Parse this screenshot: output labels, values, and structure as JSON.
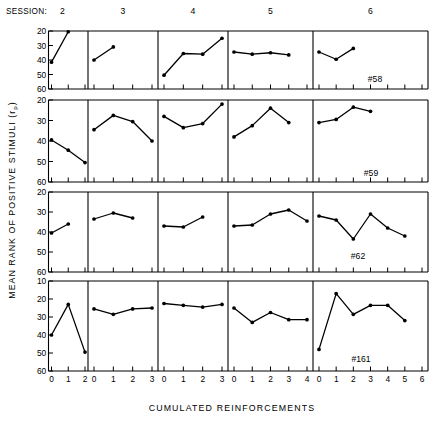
{
  "figure": {
    "session_word": "SESSION:",
    "y_axis_title_main": "MEAN RANK OF POSITIVE STIMULI (r",
    "y_axis_title_sub": "p",
    "y_axis_title_close": ")",
    "x_axis_title": "CUMULATED  REINFORCEMENTS"
  },
  "chart_data": {
    "type": "line",
    "title": "",
    "xlabel": "CUMULATED  REINFORCEMENTS",
    "ylabel": "MEAN RANK OF POSITIVE STIMULI (rp)",
    "y_inverted": true,
    "grid": false,
    "legend": "none",
    "columns": [
      {
        "session": "2",
        "x": [
          0,
          1,
          2
        ]
      },
      {
        "session": "3",
        "x": [
          0,
          1,
          2,
          3
        ]
      },
      {
        "session": "4",
        "x": [
          0,
          1,
          2,
          3
        ]
      },
      {
        "session": "5",
        "x": [
          0,
          1,
          2,
          3,
          4
        ]
      },
      {
        "session": "6",
        "x": [
          0,
          1,
          2,
          3,
          4,
          5,
          6
        ]
      }
    ],
    "rows": [
      {
        "subject": "#58",
        "ylim": [
          20,
          60
        ],
        "yticks": [
          20,
          30,
          40,
          50,
          60
        ],
        "panels": [
          {
            "session": "2",
            "x": [
              0,
              1
            ],
            "values": [
              41.5,
              20.5
            ]
          },
          {
            "session": "3",
            "x": [
              0,
              1
            ],
            "values": [
              40.0,
              31.0
            ]
          },
          {
            "session": "4",
            "x": [
              0,
              1,
              2,
              3
            ],
            "values": [
              50.5,
              35.5,
              36.0,
              25.0
            ]
          },
          {
            "session": "5",
            "x": [
              0,
              1,
              2,
              3
            ],
            "values": [
              34.5,
              36.0,
              35.0,
              36.5
            ]
          },
          {
            "session": "6",
            "x": [
              0,
              1,
              2
            ],
            "values": [
              34.5,
              39.5,
              32.0
            ]
          }
        ]
      },
      {
        "subject": "#59",
        "ylim": [
          20,
          60
        ],
        "yticks": [
          20,
          30,
          40,
          50,
          60
        ],
        "panels": [
          {
            "session": "2",
            "x": [
              0,
              1,
              2
            ],
            "values": [
              39.5,
              44.5,
              50.5
            ]
          },
          {
            "session": "3",
            "x": [
              0,
              1,
              2,
              3
            ],
            "values": [
              34.5,
              27.5,
              30.5,
              40.0
            ]
          },
          {
            "session": "4",
            "x": [
              0,
              1,
              2,
              3
            ],
            "values": [
              28.0,
              33.5,
              31.5,
              22.0
            ]
          },
          {
            "session": "5",
            "x": [
              0,
              1,
              2,
              3
            ],
            "values": [
              38.0,
              32.5,
              24.0,
              31.0
            ]
          },
          {
            "session": "6",
            "x": [
              0,
              1,
              2,
              3
            ],
            "values": [
              31.0,
              29.5,
              23.5,
              25.5
            ]
          }
        ]
      },
      {
        "subject": "#62",
        "ylim": [
          20,
          60
        ],
        "yticks": [
          20,
          30,
          40,
          50,
          60
        ],
        "panels": [
          {
            "session": "2",
            "x": [
              0,
              1
            ],
            "values": [
              40.5,
              36.0
            ]
          },
          {
            "session": "3",
            "x": [
              0,
              1,
              2
            ],
            "values": [
              33.5,
              30.5,
              33.0
            ]
          },
          {
            "session": "4",
            "x": [
              0,
              1,
              2
            ],
            "values": [
              37.0,
              37.5,
              32.5
            ]
          },
          {
            "session": "5",
            "x": [
              0,
              1,
              2,
              3,
              4
            ],
            "values": [
              37.0,
              36.5,
              31.0,
              29.0,
              34.5
            ]
          },
          {
            "session": "6",
            "x": [
              0,
              1,
              2,
              3,
              4,
              5
            ],
            "values": [
              32.0,
              34.0,
              43.5,
              31.0,
              38.0,
              42.0
            ]
          }
        ]
      },
      {
        "subject": "#161",
        "ylim": [
          10,
          60
        ],
        "yticks": [
          10,
          20,
          30,
          40,
          50,
          60
        ],
        "panels": [
          {
            "session": "2",
            "x": [
              0,
              1,
              2
            ],
            "values": [
              40.0,
              23.0,
              49.5
            ]
          },
          {
            "session": "3",
            "x": [
              0,
              1,
              2,
              3
            ],
            "values": [
              25.5,
              28.5,
              25.5,
              25.0
            ]
          },
          {
            "session": "4",
            "x": [
              0,
              1,
              2,
              3
            ],
            "values": [
              22.5,
              23.5,
              24.5,
              23.0
            ]
          },
          {
            "session": "5",
            "x": [
              0,
              1,
              2,
              3,
              4
            ],
            "values": [
              25.0,
              33.0,
              27.5,
              31.5,
              31.5
            ]
          },
          {
            "session": "6",
            "x": [
              0,
              1,
              2,
              3,
              4,
              5,
              6
            ],
            "values": [
              48.0,
              17.0,
              28.5,
              23.5,
              23.5,
              32.0
            ]
          }
        ]
      }
    ]
  }
}
